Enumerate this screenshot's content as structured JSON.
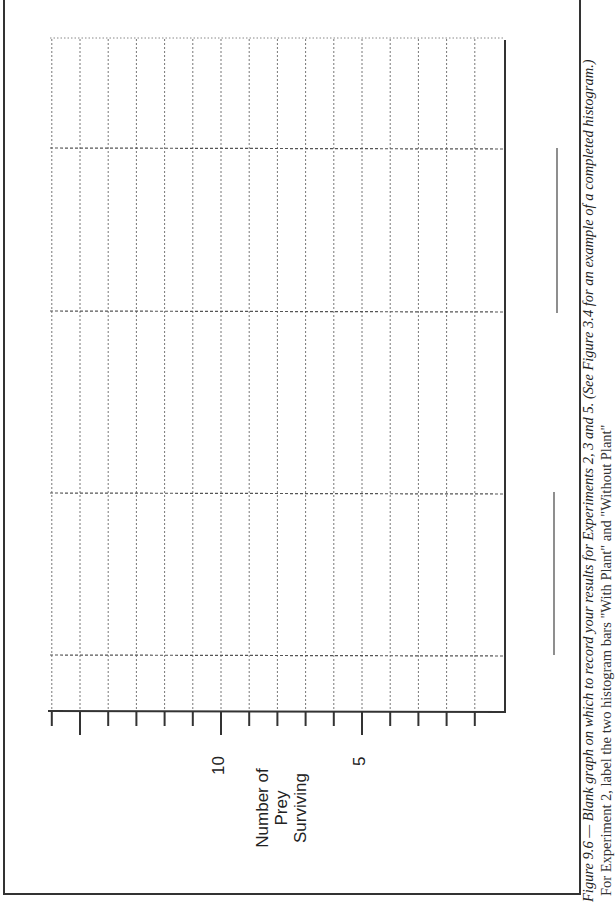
{
  "figure": {
    "caption_title": "Figure 9.6 — Blank graph on which to record your results for Experiments 2, 3 and 5. (See Figure 3.4 for an example of a completed histogram.)",
    "caption_body": "For Experiment 2, label the two histogram bars \"With Plant\" and \"Without Plant\""
  },
  "axis": {
    "label_lines": [
      "Number of",
      "Prey",
      "Surviving"
    ],
    "tick_labels": [
      {
        "value": 10,
        "text": "10"
      },
      {
        "value": 5,
        "text": "5"
      }
    ]
  },
  "chart_data": {
    "type": "bar",
    "title": "Blank graph on which to record your results for Experiments 2, 3 and 5",
    "orientation": "rotated 90° (page landscape); value axis along bottom of image",
    "ylabel": "Number of Prey Surviving",
    "xlabel": "",
    "ylim": [
      0,
      16
    ],
    "y_ticks": [
      0,
      1,
      2,
      3,
      4,
      5,
      6,
      7,
      8,
      9,
      10,
      11,
      12,
      13,
      14,
      15,
      16
    ],
    "y_tick_labels": {
      "5": "5",
      "10": "10"
    },
    "categories": [
      "",
      "",
      "",
      ""
    ],
    "category_note": "four blank bar slots with blank label underlines",
    "series": [],
    "grid": true,
    "legend": "none"
  }
}
